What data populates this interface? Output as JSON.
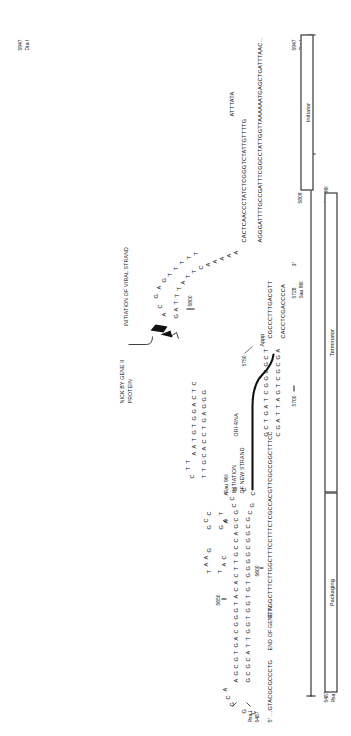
{
  "figure": {
    "title_semantic": "f1-phage-origin-of-replication-secondary-structure",
    "annotations": {
      "nick_by_gene_ii": "NICK BY GENE II\nPROTEIN",
      "nick_line1": "NICK BY GENE II",
      "nick_line2": "PROTEIN",
      "initiation_viral": "INITIATION OF VIRAL STRAND",
      "initiation_new_line1": "INITIATION",
      "initiation_new_line2": "OF NEW STRAND",
      "ori_rna": "ORI-RNA",
      "end_of_gene_iv": "END OF GENE IV",
      "appp": "Appp",
      "five_prime": "5'",
      "three_prime": "3'"
    },
    "enzyme_sites": {
      "rsa_i": "Rsa I",
      "sau_96i": "Sau 96I",
      "dra_i": "Dra I"
    },
    "coordinates": {
      "c5487": "5487",
      "c5600": "5600",
      "c5650": "5650",
      "c5700": "5700",
      "c5728": "5728",
      "c5750": "5750",
      "c5800": "5800",
      "c5809": "5809",
      "c5947": "5947"
    },
    "domain_bars": [
      {
        "name": "packaging",
        "label": "Packaging"
      },
      {
        "name": "terminator",
        "label": "Terminator"
      },
      {
        "name": "initiator",
        "label": "Initiator"
      }
    ],
    "linear_sequences": {
      "left_5prime_tail": "5'  ...GTACGCGCCCTG",
      "top_strand_long": "TTTGGCTTTCTTGGCTTTCCTTTCTCGCCACGTTCGCCGGCTTTCC",
      "mid_strand": "CACCTCGACCCCA",
      "appp_strand": "CGCCCTTTGACGTT",
      "upper_strand": "CACTCAACCCTATCTCGGGTCTATTGTTTTG",
      "loop_attata": "ATTTATA",
      "right_strand_long": "AGGGATTTTGCCGATTTCGGCCTATTGGTTAAAAAATGAGCTGATTTAAC...",
      "right_3prime_tail": "3'"
    },
    "hairpin_bases": {
      "domain_a_top": [
        "G",
        "C",
        "A"
      ],
      "domain_a_upper": [
        "A",
        "G",
        "C",
        "G",
        "T",
        "G",
        "A",
        "C",
        "G",
        "G",
        "G",
        "T",
        "A",
        "C",
        "A",
        "C",
        "T",
        "T",
        "G",
        "C",
        "C",
        "A",
        "G",
        "C",
        "G",
        "C",
        "C"
      ],
      "domain_a_lower": [
        "G",
        "C",
        "G",
        "C",
        "A",
        "T",
        "T",
        "G",
        "G",
        "T",
        "G",
        "G",
        "T",
        "G",
        "T",
        "G",
        "G",
        "G",
        "G",
        "C",
        "G",
        "G",
        "C",
        "G",
        "C",
        "G"
      ],
      "domain_a_bottomleft": [
        "G",
        "C"
      ],
      "domain_a_loop_right": [
        "A",
        "A",
        "G",
        "C",
        "C"
      ],
      "domain_b_topA": [
        "T",
        "A",
        "A",
        "G"
      ],
      "domain_b_topB": [
        "G",
        "C",
        "C"
      ],
      "domain_b_lowA": [
        "T",
        "A",
        "C"
      ],
      "domain_b_lowB": [
        "G",
        "A",
        "T"
      ],
      "domain_b_stem_top": [
        "G",
        "C",
        "G",
        "C",
        "G",
        "G",
        "C",
        "G",
        "C",
        "G",
        "G",
        "T",
        "C"
      ],
      "domain_b_stem_bot": [
        "C",
        "G",
        "C",
        "G",
        "G",
        "C",
        "G",
        "G",
        "C",
        "A",
        "T",
        "C"
      ],
      "domain_c_top": [
        "C",
        "T",
        "T"
      ],
      "domain_c_upper": [
        "A",
        "A",
        "T",
        "G",
        "T",
        "G",
        "G",
        "A",
        "C",
        "T",
        "C"
      ],
      "domain_c_lower": [
        "T",
        "T",
        "G",
        "C",
        "A",
        "C",
        "C",
        "T",
        "G",
        "A",
        "G",
        "G",
        "G"
      ],
      "domain_c_loop": [
        "A",
        "A",
        "C",
        "T",
        "G",
        "G",
        "A",
        "C",
        "C",
        "T",
        "T",
        "A",
        "C",
        "A",
        "A"
      ],
      "domain_d_upper": [
        "A",
        "C",
        "G",
        "A",
        "G",
        "T",
        "T",
        "T",
        "T",
        "T"
      ],
      "domain_d_lower": [
        "G",
        "A",
        "T",
        "T",
        "T",
        "A",
        "T",
        "T",
        "C",
        "A",
        "A",
        "A",
        "A",
        "A"
      ],
      "domain_ori_top": [
        "G",
        "C",
        "T",
        "G",
        "A",
        "T",
        "C",
        "G",
        "G",
        "C",
        "G",
        "C",
        "T"
      ],
      "domain_ori_bot": [
        "C",
        "G",
        "A",
        "T",
        "T",
        "A",
        "G",
        "T",
        "C",
        "G",
        "C",
        "G",
        "A"
      ]
    }
  }
}
